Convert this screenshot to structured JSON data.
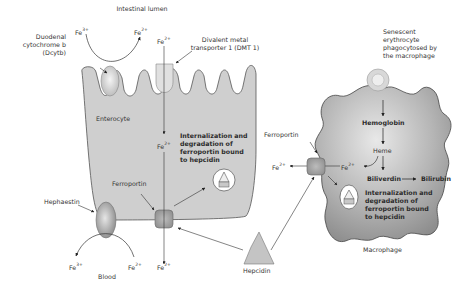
{
  "diagram": {
    "type": "iron-absorption-and-recycling",
    "colors": {
      "cell_fill": "#cfcfcf",
      "cell_stroke": "#555555",
      "macrophage_fill": "#a9a9a9",
      "line": "#333333",
      "protein_fill": "#bdbdbd"
    },
    "regions": {
      "top": "Intestinal lumen",
      "bottom": "Blood"
    },
    "enterocyte": {
      "label": "Enterocyte",
      "dcytb_label_1": "Duodenal",
      "dcytb_label_2": "cytochrome b",
      "dcytb_label_3": "(Dcytb)",
      "dmt1_label_1": "Divalent metal",
      "dmt1_label_2": "transporter 1 (DMT 1)",
      "ferroportin_label": "Ferroportin",
      "hephaestin_label": "Hephaestin",
      "internalization_lines": [
        "Internalization and",
        "degradation of",
        "ferroportin bound",
        "to hepcidin"
      ]
    },
    "macrophage": {
      "label": "Macrophage",
      "erythrocyte_lines": [
        "Senescent",
        "erythrocyte",
        "phagocytosed by",
        "the macrophage"
      ],
      "hemoglobin": "Hemoglobin",
      "heme": "Heme",
      "biliverdin": "Biliverdin",
      "bilirubin": "Bilirubin",
      "ferroportin_label": "Ferroportin",
      "internalization_lines": [
        "Internalization and",
        "degradation of",
        "ferroportin bound",
        "to hepcidin"
      ]
    },
    "hepcidin": {
      "label": "Hepcidin"
    },
    "ions": {
      "fe_base": "Fe",
      "fe3": "3+",
      "fe2": "2+"
    }
  }
}
